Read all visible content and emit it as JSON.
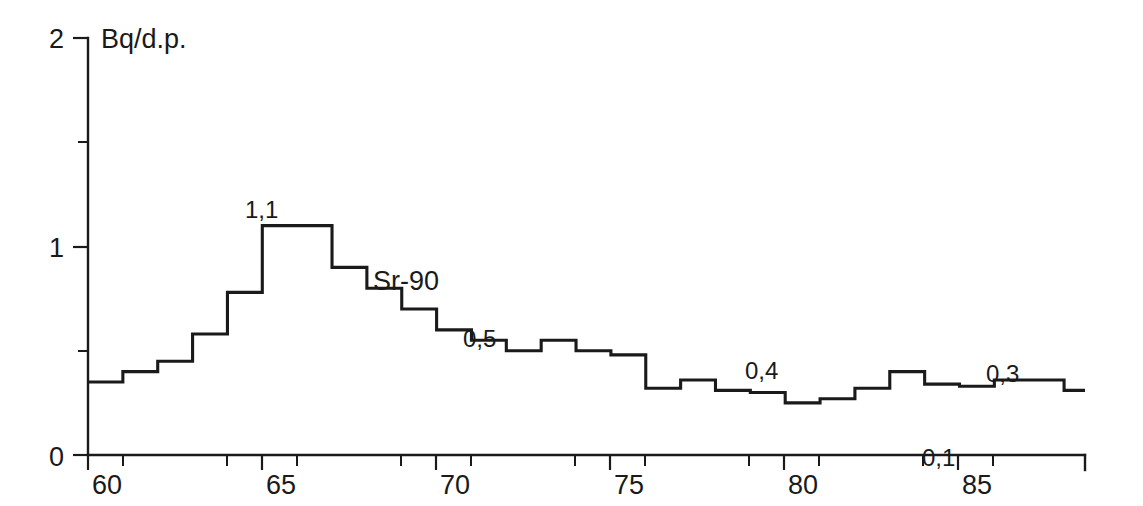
{
  "chart_data": {
    "type": "line",
    "subtype": "step",
    "title": "",
    "xlabel": "",
    "ylabel": "Bq/d.p.",
    "ylim": [
      0,
      2
    ],
    "xlim": [
      60,
      88.6
    ],
    "grid": false,
    "legend_position": "inline-annotation",
    "series": [
      {
        "name": "Sr-90",
        "x": [
          60,
          61,
          62,
          63,
          64,
          65,
          66,
          67,
          68,
          69,
          70,
          71,
          72,
          73,
          74,
          75,
          76,
          77,
          78,
          79,
          80,
          81,
          82,
          83,
          84,
          85,
          86,
          87,
          88
        ],
        "values": [
          0.35,
          0.4,
          0.45,
          0.58,
          0.78,
          1.1,
          1.1,
          0.9,
          0.8,
          0.7,
          0.6,
          0.55,
          0.5,
          0.55,
          0.5,
          0.48,
          0.32,
          0.36,
          0.31,
          0.3,
          0.25,
          0.27,
          0.32,
          0.4,
          0.34,
          0.33,
          0.36,
          0.36,
          0.31
        ]
      }
    ],
    "x_ticks": [
      60,
      65,
      70,
      75,
      80,
      85
    ],
    "x_tick_labels": [
      "60",
      "65",
      "70",
      "75",
      "80",
      "85"
    ],
    "x_minor_ticks": [
      61,
      64,
      66,
      69,
      71,
      74,
      76,
      79,
      81,
      84,
      86
    ],
    "y_ticks": [
      0,
      1,
      2
    ],
    "y_tick_labels": [
      "0",
      "1",
      "2"
    ],
    "y_minor_ticks": [
      0.5,
      1.5
    ],
    "annotations": [
      {
        "text": "Sr-90",
        "type": "series-name",
        "x": 69.0,
        "y": 0.97
      },
      {
        "text": "1,1",
        "type": "data-label",
        "value": 1.1,
        "x": 64.5,
        "y": 1.22
      },
      {
        "text": "0,5",
        "type": "data-label",
        "value": 0.5,
        "x": 71.2,
        "y": 0.62
      },
      {
        "text": "0,4",
        "type": "data-label",
        "value": 0.4,
        "x": 79.2,
        "y": 0.5
      },
      {
        "text": "0,1",
        "type": "data-label",
        "value": 0.1,
        "x": 84.6,
        "y": 0.04
      },
      {
        "text": "0,3",
        "type": "data-label",
        "value": 0.3,
        "x": 86.2,
        "y": 0.46
      }
    ],
    "colors": {
      "line": "#1a1a1a",
      "axis": "#1a1a1a",
      "background": "#ffffff",
      "text": "#1a1a1a"
    }
  },
  "axis": {
    "y_label": "Bq/d.p.",
    "y_top_label": "2",
    "y_mid_label": "1",
    "y_zero_label": "0",
    "x_labels": {
      "t60": "60",
      "t65": "65",
      "t70": "70",
      "t75": "75",
      "t80": "80",
      "t85": "85"
    }
  },
  "labels": {
    "series_name": "Sr-90",
    "peak": "1,1",
    "mid70s": "0,5",
    "late70s": "0,4",
    "min85": "0,1",
    "late80s": "0,3"
  }
}
